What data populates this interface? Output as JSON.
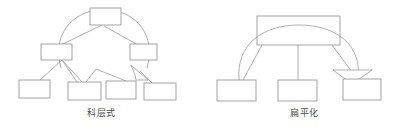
{
  "figure": {
    "width": 406,
    "height": 130,
    "background": "#ffffff",
    "stroke_color": "#8c8c8c",
    "box_fill": "#ffffff",
    "caption_color": "#4a4a4a"
  },
  "diagrams": [
    {
      "id": "hierarchical",
      "caption": "科层式",
      "caption_meaning": "hierarchical",
      "levels": 3,
      "boxes": [
        {
          "name": "top-box",
          "level": 1,
          "x": 90,
          "y": 8,
          "w": 31,
          "h": 17
        },
        {
          "name": "mid-box-left",
          "level": 2,
          "x": 41,
          "y": 44,
          "w": 31,
          "h": 16
        },
        {
          "name": "mid-box-right",
          "level": 2,
          "x": 130,
          "y": 44,
          "w": 27,
          "h": 16
        },
        {
          "name": "leaf-box-1",
          "level": 3,
          "x": 19,
          "y": 80,
          "w": 31,
          "h": 18
        },
        {
          "name": "leaf-box-2",
          "level": 3,
          "x": 68,
          "y": 82,
          "w": 33,
          "h": 18
        },
        {
          "name": "leaf-box-3",
          "level": 3,
          "x": 106,
          "y": 81,
          "w": 30,
          "h": 18
        },
        {
          "name": "leaf-box-4",
          "level": 3,
          "x": 144,
          "y": 83,
          "w": 32,
          "h": 17
        }
      ],
      "connectors": [
        {
          "name": "top-to-mid-left",
          "from": [
            102,
            25
          ],
          "to": [
            62,
            45
          ]
        },
        {
          "name": "top-to-mid-right",
          "from": [
            104,
            26
          ],
          "to": [
            138,
            45
          ]
        },
        {
          "name": "mid-left-to-leaf-1",
          "from": [
            62,
            60
          ],
          "to": [
            40,
            80
          ]
        },
        {
          "name": "mid-left-to-leaf-2",
          "from": [
            62,
            60
          ],
          "to": [
            78,
            82
          ]
        },
        {
          "name": "mid-left-to-leaf-2b",
          "from": [
            63,
            61
          ],
          "to": [
            82,
            82
          ]
        },
        {
          "name": "mid-peak-to-leaf-2",
          "from": [
            96,
            70
          ],
          "to": [
            86,
            82
          ]
        },
        {
          "name": "mid-peak-to-leaf-3",
          "from": [
            96,
            70
          ],
          "to": [
            125,
            81
          ]
        },
        {
          "name": "arrowhead-to-leaf-4",
          "from": [
            140,
            72
          ],
          "to": [
            150,
            83
          ]
        }
      ],
      "arcs": [
        {
          "name": "big-arc-left",
          "cx": 104,
          "cy": 46,
          "rx": 46,
          "ry": 38,
          "start_deg": 200,
          "end_deg": 350
        }
      ],
      "arrowheads": [
        {
          "name": "arrowhead-left-diagram",
          "points": "133,66 148,80 137,80 136,76",
          "tip": [
            148,
            80
          ]
        }
      ]
    },
    {
      "id": "flat",
      "caption": "扁平化",
      "caption_meaning": "flattened",
      "levels": 2,
      "boxes": [
        {
          "name": "top-box",
          "level": 1,
          "x": 257,
          "y": 16,
          "w": 83,
          "h": 29
        },
        {
          "name": "leaf-box-1",
          "level": 2,
          "x": 217,
          "y": 80,
          "w": 39,
          "h": 21
        },
        {
          "name": "leaf-box-2",
          "level": 2,
          "x": 278,
          "y": 80,
          "w": 39,
          "h": 21
        },
        {
          "name": "leaf-box-3",
          "level": 2,
          "x": 343,
          "y": 79,
          "w": 38,
          "h": 21
        }
      ],
      "connectors": [
        {
          "name": "top-to-leaf-1",
          "from": [
            262,
            45
          ],
          "to": [
            242,
            80
          ]
        },
        {
          "name": "top-to-leaf-2",
          "from": [
            298,
            45
          ],
          "to": [
            298,
            80
          ]
        },
        {
          "name": "top-to-leaf-3",
          "from": [
            332,
            45
          ],
          "to": [
            356,
            75
          ]
        }
      ],
      "arcs": [
        {
          "name": "big-arc-right",
          "cx": 299,
          "cy": 48,
          "rx": 62,
          "ry": 30,
          "start_deg": 190,
          "end_deg": 355
        }
      ],
      "arrowheads": [
        {
          "name": "arrowhead-right-diagram",
          "points": "334,71 372,71 353,83",
          "tip": [
            353,
            83
          ]
        }
      ]
    }
  ]
}
